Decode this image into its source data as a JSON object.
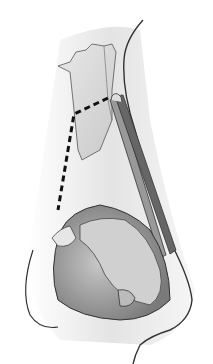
{
  "image": {
    "subject": "nasal anatomy illustration",
    "style": "grayscale medical illustration",
    "background": "#ffffff",
    "colors": {
      "outline": "#333333",
      "shade_dark": "#8a8a8a",
      "shade_mid": "#bdbdbd",
      "shade_light": "#e2e2e2",
      "dashed_line": "#111111"
    }
  }
}
